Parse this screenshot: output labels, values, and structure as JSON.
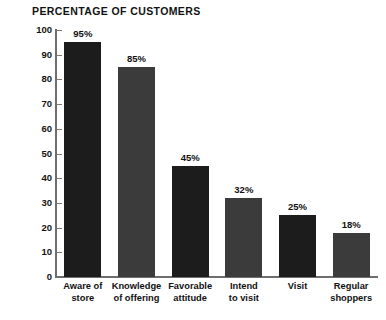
{
  "chart_data": {
    "type": "bar",
    "title": "PERCENTAGE OF CUSTOMERS",
    "xlabel": "",
    "ylabel": "",
    "ylim": [
      0,
      100
    ],
    "yticks": [
      0,
      10,
      20,
      30,
      40,
      50,
      60,
      70,
      80,
      90,
      100
    ],
    "ytick_labels": [
      "0",
      "10",
      "20",
      "30",
      "40",
      "50",
      "60",
      "70",
      "80",
      "90",
      "100"
    ],
    "grid": false,
    "legend": false,
    "categories": [
      "Aware of store",
      "Knowledge of offering",
      "Favorable attitude",
      "Intend to visit",
      "Visit",
      "Regular shoppers"
    ],
    "category_lines": [
      [
        "Aware of",
        "store"
      ],
      [
        "Knowledge",
        "of offering"
      ],
      [
        "Favorable",
        "attitude"
      ],
      [
        "Intend",
        "to visit"
      ],
      [
        "Visit",
        ""
      ],
      [
        "Regular",
        "shoppers"
      ]
    ],
    "values": [
      95,
      85,
      45,
      32,
      25,
      18
    ],
    "value_labels": [
      "95%",
      "85%",
      "45%",
      "32%",
      "25%",
      "18%"
    ],
    "bar_colors": [
      "#1c1c1c",
      "#3b3b3b",
      "#1c1c1c",
      "#3b3b3b",
      "#1c1c1c",
      "#3b3b3b"
    ],
    "axis_color": "#6e6e6e",
    "background": "#ffffff",
    "text_color": "#111111"
  }
}
